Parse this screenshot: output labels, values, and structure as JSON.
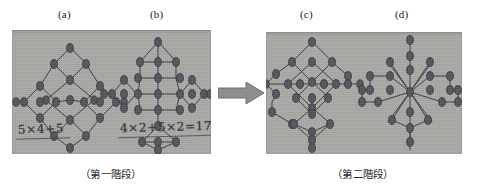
{
  "figure": {
    "type": "diagram",
    "panel_labels": {
      "a": "(a)",
      "b": "(b)",
      "c": "(c)",
      "d": "(d)"
    },
    "handwritten_equations": {
      "under_a": "5×4+5",
      "under_b": "4×2+5×2=17"
    },
    "captions": {
      "left": "（第一階段）",
      "right": "（第二階段）"
    },
    "arrow": {
      "name": "right-arrow",
      "direction": "right",
      "color": "#8a8a8a"
    },
    "colors": {
      "paper": "#a9a9a6",
      "ink": "#33333a",
      "text": "#1b1b1b",
      "arrow": "#8a8a8a",
      "page_background": "#ffffff"
    }
  }
}
